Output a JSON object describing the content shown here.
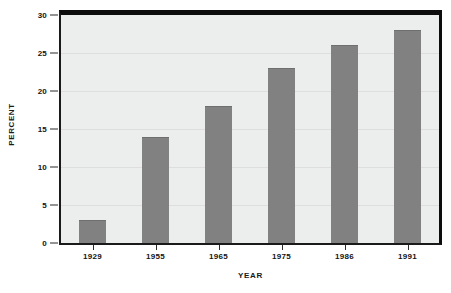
{
  "chart_data": {
    "type": "bar",
    "title": "",
    "subtitle": "",
    "xlabel": "Y E A R",
    "ylabel": "P E R C E N T",
    "categories": [
      "1929",
      "1955",
      "1965",
      "1975",
      "1986",
      "1991"
    ],
    "values": [
      3,
      14,
      18,
      23,
      26,
      28
    ],
    "series": [
      {
        "name": "Percent",
        "values": [
          3,
          14,
          18,
          23,
          26,
          28
        ]
      }
    ],
    "ylim": [
      0,
      30
    ],
    "yticks": [
      0,
      5,
      10,
      15,
      20,
      25,
      30
    ],
    "ytick_labels": [
      "0",
      "5",
      "10",
      "15",
      "20",
      "25",
      "30"
    ],
    "grid": true,
    "grid_axis": "y",
    "legend": false,
    "legend_position": "none",
    "bar_color": "#818181",
    "plot_background": "#eceded",
    "gridline_color": "#dddedd",
    "axis_color": "#0d0d0d",
    "text_color": "#141414",
    "page_background": "#ffffff",
    "annotations": []
  },
  "axis_titles": {
    "y": "PERCENT",
    "x": "YEAR"
  }
}
